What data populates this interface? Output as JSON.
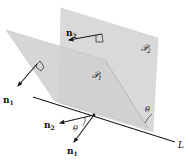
{
  "figure": {
    "colors": {
      "plane_fill": "#d6d6d6",
      "plane_overlap": "#c4c4c4",
      "stroke": "#1a1a1a",
      "background": "#ffffff"
    }
  },
  "labels": {
    "plane1": "𝒫",
    "plane1_sub": "1",
    "plane2": "𝒫",
    "plane2_sub": "2",
    "normal1_top": "n",
    "normal1_top_sub": "1",
    "normal2_top": "n",
    "normal2_top_sub": "2",
    "normal1_bottom": "n",
    "normal1_bottom_sub": "1",
    "normal2_bottom": "n",
    "normal2_bottom_sub": "2",
    "theta_bottom": "θ",
    "theta_right": "θ",
    "line": "L"
  }
}
